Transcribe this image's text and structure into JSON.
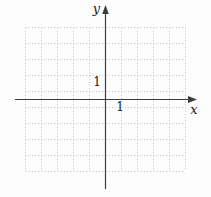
{
  "figure": {
    "x_axis_label": "x",
    "y_axis_label": "y",
    "x_unit_tick_label": "1",
    "y_unit_tick_label": "1",
    "grid": {
      "columns": 10,
      "rows": 9,
      "line_style": "dotted",
      "color": "#c0c0c0"
    },
    "axis": {
      "color": "#3d3d3d",
      "label_color": "#1a1a1a",
      "x_arrow_direction": "right",
      "y_arrow_direction": "up"
    },
    "background_color": "#fdfdfd"
  }
}
